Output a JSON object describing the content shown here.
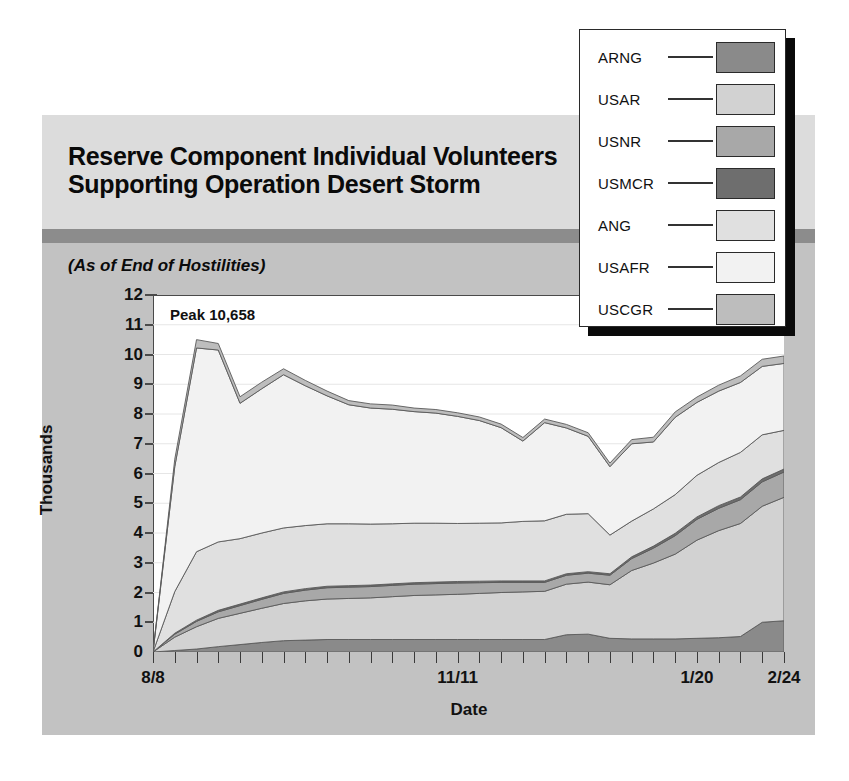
{
  "title": {
    "line1": "Reserve Component Individual Volunteers",
    "line2": "Supporting Operation Desert Storm",
    "subtitle": "(As of End of Hostilities)"
  },
  "annotation": {
    "peak": "Peak  10,658"
  },
  "legend": {
    "items": [
      {
        "label": "ARNG",
        "color": "#8a8a8a"
      },
      {
        "label": "USAR",
        "color": "#d2d2d2"
      },
      {
        "label": "USNR",
        "color": "#a8a8a8"
      },
      {
        "label": "USMCR",
        "color": "#6e6e6e"
      },
      {
        "label": "ANG",
        "color": "#e0e0e0"
      },
      {
        "label": "USAFR",
        "color": "#f2f2f2"
      },
      {
        "label": "USCGR",
        "color": "#bdbdbd"
      }
    ]
  },
  "chart_data": {
    "type": "area",
    "stacked": true,
    "title": "Reserve Component Individual Volunteers Supporting Operation Desert Storm",
    "subtitle": "(As of End of Hostilities)",
    "xlabel": "Date",
    "ylabel": "Thousands",
    "ylim": [
      0,
      12
    ],
    "yticks": [
      0,
      1,
      2,
      3,
      4,
      5,
      6,
      7,
      8,
      9,
      10,
      11,
      12
    ],
    "ytick_labels": [
      "0",
      "1",
      "2",
      "3",
      "4",
      "5",
      "6",
      "7",
      "8",
      "9",
      "10",
      "11",
      "12"
    ],
    "grid": true,
    "legend_position": "top-right-outside",
    "annotation": "Peak  10,658",
    "peak_value": 10658,
    "x_tick_count": 30,
    "xtick_labels": [
      "8/8",
      "11/11",
      "1/20",
      "2/24"
    ],
    "xtick_label_index": [
      0,
      14,
      25,
      29
    ],
    "x": [
      "8/8",
      "8/15",
      "8/22",
      "8/29",
      "9/5",
      "9/12",
      "9/19",
      "9/26",
      "10/3",
      "10/10",
      "10/17",
      "10/24",
      "10/31",
      "11/4",
      "11/11",
      "11/18",
      "11/25",
      "12/2",
      "12/9",
      "12/16",
      "12/23",
      "12/30",
      "1/6",
      "1/13",
      "1/20",
      "1/27",
      "2/3",
      "2/10",
      "2/17",
      "2/24"
    ],
    "series": [
      {
        "name": "ARNG",
        "color": "#8a8a8a",
        "values": [
          0.0,
          0.05,
          0.1,
          0.18,
          0.25,
          0.32,
          0.38,
          0.4,
          0.42,
          0.42,
          0.42,
          0.42,
          0.42,
          0.42,
          0.42,
          0.42,
          0.42,
          0.42,
          0.42,
          0.58,
          0.6,
          0.46,
          0.44,
          0.44,
          0.44,
          0.46,
          0.48,
          0.52,
          1.0,
          1.05
        ]
      },
      {
        "name": "USAR",
        "color": "#d2d2d2",
        "values": [
          0.0,
          0.45,
          0.75,
          0.95,
          1.05,
          1.15,
          1.25,
          1.32,
          1.36,
          1.38,
          1.4,
          1.44,
          1.48,
          1.5,
          1.52,
          1.55,
          1.58,
          1.6,
          1.62,
          1.7,
          1.75,
          1.8,
          2.3,
          2.55,
          2.85,
          3.3,
          3.6,
          3.8,
          3.9,
          4.15
        ]
      },
      {
        "name": "USNR",
        "color": "#a8a8a8",
        "values": [
          0.0,
          0.1,
          0.18,
          0.22,
          0.26,
          0.3,
          0.34,
          0.36,
          0.38,
          0.38,
          0.38,
          0.38,
          0.38,
          0.38,
          0.38,
          0.36,
          0.34,
          0.32,
          0.3,
          0.3,
          0.3,
          0.32,
          0.4,
          0.5,
          0.62,
          0.7,
          0.75,
          0.8,
          0.82,
          0.85
        ]
      },
      {
        "name": "USMCR",
        "color": "#6e6e6e",
        "values": [
          0.0,
          0.03,
          0.04,
          0.05,
          0.05,
          0.05,
          0.05,
          0.05,
          0.05,
          0.05,
          0.05,
          0.05,
          0.05,
          0.05,
          0.05,
          0.05,
          0.05,
          0.05,
          0.05,
          0.05,
          0.05,
          0.05,
          0.06,
          0.07,
          0.08,
          0.08,
          0.09,
          0.09,
          0.1,
          0.1
        ]
      },
      {
        "name": "ANG",
        "color": "#e0e0e0",
        "values": [
          0.0,
          1.4,
          2.3,
          2.3,
          2.2,
          2.18,
          2.15,
          2.12,
          2.1,
          2.08,
          2.05,
          2.02,
          2.0,
          1.98,
          1.95,
          1.95,
          1.95,
          2.0,
          2.02,
          2.0,
          1.95,
          1.3,
          1.2,
          1.25,
          1.3,
          1.4,
          1.45,
          1.5,
          1.48,
          1.3
        ]
      },
      {
        "name": "USAFR",
        "color": "#f2f2f2",
        "values": [
          0.0,
          4.2,
          6.85,
          6.45,
          4.55,
          4.85,
          5.15,
          4.7,
          4.3,
          4.0,
          3.9,
          3.85,
          3.75,
          3.7,
          3.6,
          3.45,
          3.2,
          2.7,
          3.3,
          2.9,
          2.6,
          2.3,
          2.6,
          2.25,
          2.6,
          2.45,
          2.4,
          2.35,
          2.3,
          2.25
        ]
      },
      {
        "name": "USCGR",
        "color": "#bdbdbd",
        "values": [
          0.0,
          0.25,
          0.28,
          0.22,
          0.22,
          0.22,
          0.2,
          0.18,
          0.16,
          0.14,
          0.14,
          0.14,
          0.12,
          0.12,
          0.12,
          0.12,
          0.12,
          0.12,
          0.12,
          0.12,
          0.12,
          0.12,
          0.14,
          0.16,
          0.18,
          0.18,
          0.2,
          0.22,
          0.24,
          0.25
        ]
      }
    ]
  }
}
